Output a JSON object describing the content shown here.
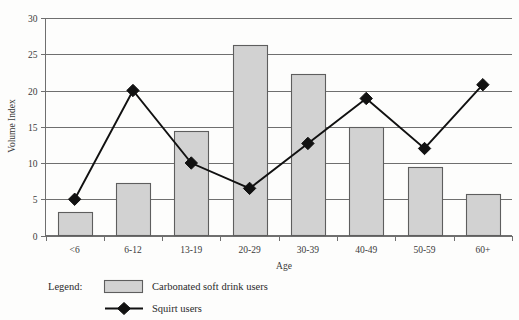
{
  "chart_data": {
    "type": "bar",
    "title": "",
    "xlabel": "Age",
    "ylabel": "Volume Index",
    "categories": [
      "<6",
      "6-12",
      "13-19",
      "20-29",
      "30-39",
      "40-49",
      "50-59",
      "60+"
    ],
    "ylim": [
      0,
      30
    ],
    "yticks": [
      0,
      5,
      10,
      15,
      20,
      25,
      30
    ],
    "ytick_labels": [
      "0",
      "5",
      "10",
      "15",
      "20",
      "25",
      "30"
    ],
    "grid": true,
    "legend_position": "below-plot-left",
    "legend_label": "Legend:",
    "series": [
      {
        "name": "Carbonated soft drink users",
        "type": "bar",
        "values": [
          3.3,
          7.2,
          14.4,
          26.3,
          22.3,
          15.0,
          9.4,
          5.7
        ]
      },
      {
        "name": "Squirt users",
        "type": "line",
        "values": [
          5.0,
          20.0,
          10.0,
          6.5,
          12.7,
          18.9,
          12.0,
          20.8
        ]
      }
    ]
  },
  "legend": {
    "label": "Legend:",
    "entries": [
      {
        "name": "Carbonated soft drink users",
        "marker": "filled-square-swatch"
      },
      {
        "name": "Squirt users",
        "marker": "line-with-diamond"
      }
    ]
  },
  "colors": {
    "bar_fill": "#d2d2d2",
    "bar_stroke": "#5e5e5e",
    "line": "#111111",
    "grid": "#6f6f6f",
    "background": "#fdfdfc",
    "text": "#2a2a2a"
  }
}
